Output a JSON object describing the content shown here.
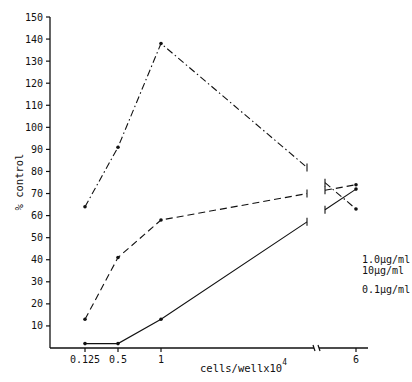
{
  "chart_data": {
    "type": "line",
    "title": "",
    "xlabel": "cells/wellx10",
    "xlabel_superscript": "4",
    "ylabel": "% control",
    "ylim": [
      0,
      150
    ],
    "yticks": [
      10,
      20,
      30,
      40,
      50,
      60,
      70,
      80,
      90,
      100,
      110,
      120,
      130,
      140,
      150
    ],
    "x": [
      0.125,
      0.5,
      1,
      6
    ],
    "x_tick_labels": [
      "0.125",
      "0.5",
      "1",
      "6"
    ],
    "x_axis_break": true,
    "grid": false,
    "series": [
      {
        "name": "0.1µg/ml",
        "line_style": "dash-dot",
        "values": [
          64,
          91,
          138,
          63
        ]
      },
      {
        "name": "1.0µg/ml",
        "line_style": "dashed",
        "values": [
          13,
          41,
          58,
          74
        ]
      },
      {
        "name": "10µg/ml",
        "line_style": "solid",
        "values": [
          2,
          2,
          13,
          72
        ]
      }
    ],
    "legend_position": "inline-right"
  }
}
